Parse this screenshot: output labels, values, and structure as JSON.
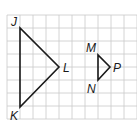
{
  "grid": {
    "x0": 7,
    "y0": 15,
    "cell": 13,
    "cols": 10,
    "rows": 8,
    "color": "#c9c9c9"
  },
  "triangles": [
    {
      "name": "JKL",
      "vertices": [
        {
          "label": "J",
          "x": 20,
          "y": 28,
          "lx": 11,
          "ly": 26
        },
        {
          "label": "K",
          "x": 20,
          "y": 107,
          "lx": 10,
          "ly": 120
        },
        {
          "label": "L",
          "x": 59,
          "y": 67,
          "lx": 63,
          "ly": 72
        }
      ]
    },
    {
      "name": "MNP",
      "vertices": [
        {
          "label": "M",
          "x": 98,
          "y": 55,
          "lx": 86,
          "ly": 52
        },
        {
          "label": "N",
          "x": 98,
          "y": 80,
          "lx": 87,
          "ly": 93
        },
        {
          "label": "P",
          "x": 110,
          "y": 67,
          "lx": 113,
          "ly": 72
        }
      ]
    }
  ],
  "colors": {
    "stroke": "#1a1a1a",
    "background": "#ffffff"
  }
}
